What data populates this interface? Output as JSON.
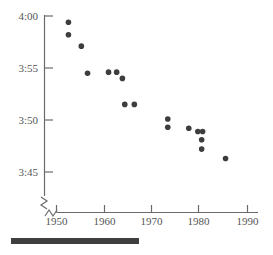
{
  "chart_data": {
    "type": "scatter",
    "title": "",
    "subtitle": "",
    "xlabel": "",
    "ylabel": "",
    "xlim": [
      1947,
      1992
    ],
    "ylim": [
      225,
      241.5
    ],
    "grid": false,
    "legend": null,
    "x_ticks": [
      1950,
      1960,
      1970,
      1980,
      1990
    ],
    "x_tick_labels": [
      "1950",
      "1960",
      "1970",
      "1980",
      "1990"
    ],
    "y_ticks": [
      240,
      235,
      230,
      225
    ],
    "y_tick_labels": [
      "4:00",
      "3:55",
      "3:50",
      "3:45"
    ],
    "axis_break": true,
    "series": [
      {
        "name": "World record mile time",
        "marker": "filled-circle",
        "color": "#3d3d3d",
        "points": [
          {
            "x": 1952.5,
            "y": 239.4,
            "label": "3:59.4"
          },
          {
            "x": 1952.5,
            "y": 238.2,
            "label": "3:58.2"
          },
          {
            "x": 1955.2,
            "y": 237.1,
            "label": "3:57.1"
          },
          {
            "x": 1956.5,
            "y": 234.5,
            "label": "3:54.5"
          },
          {
            "x": 1960.9,
            "y": 234.6,
            "label": "3:54.6"
          },
          {
            "x": 1962.6,
            "y": 234.6,
            "label": "3:54.6"
          },
          {
            "x": 1963.8,
            "y": 234.0,
            "label": "3:54.0"
          },
          {
            "x": 1964.3,
            "y": 231.5,
            "label": "3:51.5"
          },
          {
            "x": 1966.3,
            "y": 231.5,
            "label": "3:51.5"
          },
          {
            "x": 1973.3,
            "y": 230.1,
            "label": "3:50.1"
          },
          {
            "x": 1973.3,
            "y": 229.3,
            "label": "3:49.3"
          },
          {
            "x": 1977.7,
            "y": 229.2,
            "label": "3:49.2"
          },
          {
            "x": 1979.6,
            "y": 228.9,
            "label": "3:48.9"
          },
          {
            "x": 1980.6,
            "y": 228.9,
            "label": "3:48.9"
          },
          {
            "x": 1980.4,
            "y": 228.1,
            "label": "3:48.1"
          },
          {
            "x": 1980.4,
            "y": 227.2,
            "label": "3:47.2"
          },
          {
            "x": 1985.4,
            "y": 226.3,
            "label": "3:46.3"
          }
        ]
      }
    ]
  },
  "axis": {
    "y_labels": [
      "4:00",
      "3:55",
      "3:50",
      "3:45"
    ],
    "x_labels": [
      "1950",
      "1960",
      "1970",
      "1980",
      "1990"
    ]
  },
  "colors": {
    "marker": "#3d3d3d",
    "axis": "#6b6b6b",
    "text": "#555555",
    "caption_bar": "#3f3f3f",
    "background": "#ffffff"
  }
}
